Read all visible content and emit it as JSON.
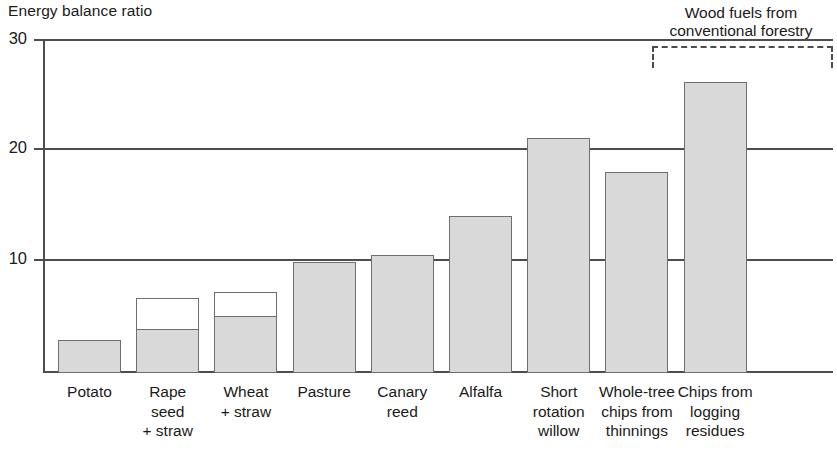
{
  "chart_data": {
    "type": "bar",
    "title": "",
    "ylabel": "Energy balance ratio",
    "xlabel": "",
    "ylim": [
      0,
      30
    ],
    "yticks": [
      10,
      20,
      30
    ],
    "ytick_labels": [
      "10",
      "20",
      "30"
    ],
    "grid": true,
    "legend_position": "none",
    "stacked": true,
    "categories": [
      "Potato",
      "Rape\nseed\n+ straw",
      "Wheat\n+ straw",
      "Pasture",
      "Canary\nreed",
      "Alfalfa",
      "Short\nrotation\nwillow",
      "Whole-tree\nchips from\nthinnings",
      "Chips from\nlogging\nresidues"
    ],
    "series": [
      {
        "name": "Main (shaded)",
        "fill": "#d9d9d9",
        "values": [
          3.0,
          4.0,
          5.2,
          10.0,
          10.6,
          14.1,
          21.1,
          18.1,
          26.1
        ]
      },
      {
        "name": "Straw increment (hollow)",
        "fill": "#ffffff",
        "values": [
          0,
          2.7,
          2.1,
          0,
          0,
          0,
          0,
          0,
          0
        ]
      }
    ],
    "totals": [
      3.0,
      6.7,
      7.3,
      10.0,
      10.6,
      14.1,
      21.1,
      18.1,
      26.1
    ],
    "annotations": [
      {
        "name": "wood-fuels-bracket",
        "text": "Wood fuels from\nconventional forestry",
        "text_line1": "Wood fuels from",
        "text_line2": "conventional forestry",
        "covers_categories": [
          "Short rotation willow",
          "Whole-tree chips from thinnings",
          "Chips from logging residues"
        ],
        "style": "dashed-bracket"
      }
    ],
    "colors": {
      "bar_fill": "#d9d9d9",
      "bar_stroke": "#6e6e6e",
      "axis": "#4d4d4d",
      "text": "#1a1a1a",
      "background": "#ffffff"
    }
  }
}
